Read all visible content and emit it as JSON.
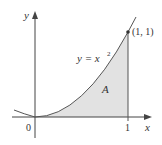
{
  "diagram": {
    "curve_label": "y = x",
    "curve_exponent": "2",
    "area_label": "A",
    "point_label": "(1, 1)",
    "origin_label": "0",
    "x_tick_label": "1",
    "x_axis_label": "x",
    "y_axis_label": "y",
    "colors": {
      "shade": "#e2e2e2",
      "curve": "#555555",
      "axis": "#444444",
      "text": "#333333"
    }
  }
}
